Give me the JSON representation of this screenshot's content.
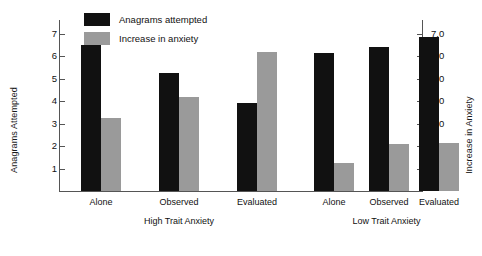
{
  "chart_data": {
    "type": "bar",
    "title": "",
    "categories": [
      "Alone",
      "Observed",
      "Evaluated",
      "Alone",
      "Observed",
      "Evaluated"
    ],
    "groups": [
      {
        "name": "High Trait Anxiety",
        "categories": [
          "Alone",
          "Observed",
          "Evaluated"
        ]
      },
      {
        "name": "Low Trait Anxiety",
        "categories": [
          "Alone",
          "Observed",
          "Evaluated"
        ]
      }
    ],
    "series": [
      {
        "name": "Anagrams attempted",
        "color": "#111111",
        "axis": "left",
        "values": [
          6.5,
          5.25,
          3.9,
          6.15,
          6.4,
          6.85
        ]
      },
      {
        "name": "Increase in anxiety",
        "color": "#9a9a9a",
        "axis": "right",
        "values": [
          3.25,
          4.2,
          6.2,
          1.25,
          2.1,
          2.15
        ]
      }
    ],
    "xlabel": "",
    "ylabel": "Anagrams Attempted",
    "y2label": "Increase in Anxiety",
    "ylim": [
      0,
      7.6
    ],
    "y2lim": [
      0,
      7.6
    ],
    "yticks": [
      "1",
      "2",
      "3",
      "4",
      "5",
      "6",
      "7"
    ],
    "ytick_values": [
      1,
      2,
      3,
      4,
      5,
      6,
      7
    ],
    "y2ticks": [
      "1.0",
      "2.0",
      "3.0",
      "4.0",
      "5.0",
      "6.0",
      "7.0"
    ],
    "y2tick_values": [
      1,
      2,
      3,
      4,
      5,
      6,
      7
    ],
    "grid": false,
    "legend_position": "top-left",
    "legend": [
      {
        "label": "Anagrams attempted",
        "color": "#111111"
      },
      {
        "label": "Increase in anxiety",
        "color": "#9a9a9a"
      }
    ]
  }
}
